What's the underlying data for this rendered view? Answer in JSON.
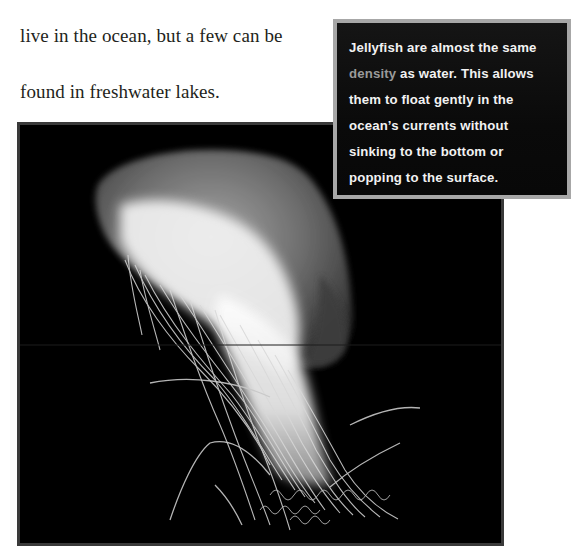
{
  "body_text": {
    "line_1": "live in the ocean, but a few can be",
    "line_2": "found in freshwater lakes."
  },
  "callout": {
    "lines": [
      "Jellyfish are almost the same",
      " as water. This allows",
      "them to float gently in the",
      "ocean’s currents without",
      "sinking to the bottom or",
      "popping to the surface."
    ],
    "highlight_term": "density",
    "colors": {
      "background": "#0c0c0c",
      "border": "#a7a7a7",
      "text": "#f2f2f2",
      "highlight": "#9a9a9a"
    }
  },
  "photo": {
    "subject": "jellyfish",
    "background_color": "#000000",
    "border_color": "#3a3a3a"
  }
}
